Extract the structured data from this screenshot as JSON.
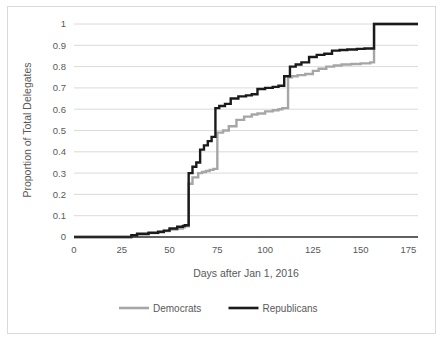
{
  "chart_data": {
    "type": "line",
    "title": "",
    "xlabel": "Days after Jan 1, 2016",
    "ylabel": "Proportion of Total Delegates",
    "xlim": [
      0,
      180
    ],
    "ylim": [
      0,
      1
    ],
    "grid": true,
    "legend_position": "bottom",
    "xticks": [
      0,
      25,
      50,
      75,
      100,
      125,
      150,
      175
    ],
    "xtick_labels": [
      "0",
      "25",
      "50",
      "75",
      "100",
      "125",
      "150",
      "175"
    ],
    "yticks": [
      0,
      0.1,
      0.2,
      0.3,
      0.4,
      0.5,
      0.6,
      0.7,
      0.8,
      0.9,
      1
    ],
    "ytick_labels": [
      "0",
      "0.1",
      "0.2",
      "0.3",
      "0.4",
      "0.5",
      "0.6",
      "0.7",
      "0.8",
      "0.9",
      "1"
    ],
    "step_type": "post",
    "series": [
      {
        "name": "Democrats",
        "color": "#a6a6a6",
        "width": 2.4,
        "x": [
          0,
          30,
          33,
          39,
          44,
          47,
          50,
          54,
          57,
          58,
          60,
          62,
          65,
          67,
          69,
          71,
          73,
          75,
          78,
          81,
          85,
          89,
          93,
          96,
          100,
          104,
          107,
          109,
          112,
          114,
          117,
          121,
          125,
          128,
          132,
          136,
          140,
          145,
          150,
          155,
          157,
          162,
          170,
          180
        ],
        "y": [
          0.0,
          0.005,
          0.012,
          0.018,
          0.022,
          0.028,
          0.035,
          0.04,
          0.045,
          0.05,
          0.25,
          0.28,
          0.3,
          0.305,
          0.31,
          0.315,
          0.32,
          0.49,
          0.5,
          0.52,
          0.55,
          0.565,
          0.575,
          0.58,
          0.59,
          0.595,
          0.6,
          0.605,
          0.75,
          0.755,
          0.76,
          0.765,
          0.78,
          0.79,
          0.8,
          0.805,
          0.81,
          0.812,
          0.815,
          0.82,
          1.0,
          1.0,
          1.0,
          1.0
        ]
      },
      {
        "name": "Republicans",
        "color": "#1a1a1a",
        "width": 2.4,
        "x": [
          0,
          30,
          33,
          39,
          44,
          47,
          50,
          54,
          57,
          58,
          60,
          62,
          64,
          66,
          68,
          70,
          72,
          74,
          76,
          79,
          82,
          86,
          90,
          93,
          96,
          100,
          104,
          107,
          110,
          113,
          116,
          119,
          123,
          127,
          131,
          135,
          139,
          143,
          148,
          152,
          156,
          157,
          163,
          170,
          180
        ],
        "y": [
          0.0,
          0.008,
          0.015,
          0.02,
          0.025,
          0.03,
          0.04,
          0.048,
          0.052,
          0.055,
          0.3,
          0.33,
          0.35,
          0.41,
          0.43,
          0.45,
          0.47,
          0.605,
          0.615,
          0.625,
          0.65,
          0.66,
          0.665,
          0.67,
          0.695,
          0.7,
          0.705,
          0.71,
          0.755,
          0.8,
          0.81,
          0.82,
          0.845,
          0.855,
          0.86,
          0.875,
          0.878,
          0.88,
          0.883,
          0.885,
          0.885,
          1.0,
          1.0,
          1.0,
          1.0
        ]
      }
    ]
  },
  "legend": {
    "items": [
      {
        "label": "Democrats",
        "color": "#a6a6a6"
      },
      {
        "label": "Republicans",
        "color": "#1a1a1a"
      }
    ]
  },
  "axes": {
    "x_title": "Days after Jan 1, 2016",
    "y_title": "Proportion of Total Delegates"
  }
}
